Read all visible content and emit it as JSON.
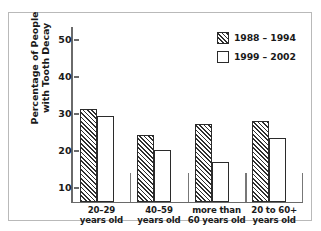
{
  "chart_data": {
    "type": "bar",
    "title": "",
    "xlabel": "",
    "ylabel_lines": [
      "Percentage of People",
      "with Tooth Decay"
    ],
    "categories": [
      [
        "20–29",
        "years old"
      ],
      [
        "40–59",
        "years old"
      ],
      [
        "more than",
        "60 years old"
      ],
      [
        "20 to 60+",
        "years old"
      ]
    ],
    "series": [
      {
        "name": "1988 – 1994",
        "style": "hatched",
        "values": [
          31.3,
          24.3,
          27.2,
          28.2
        ]
      },
      {
        "name": "1999 – 2002",
        "style": "plain",
        "values": [
          29.4,
          20.2,
          17.0,
          23.5
        ]
      }
    ],
    "ylim": [
      0,
      50
    ],
    "yticks": [
      50,
      40,
      30,
      20,
      10
    ],
    "grid": false,
    "legend_position": "top-right"
  },
  "legend": {
    "items": [
      {
        "label": "1988 – 1994",
        "style": "hatched"
      },
      {
        "label": "1999 – 2002",
        "style": "plain"
      }
    ]
  },
  "colors": {
    "ink": "#2b2b2b",
    "axis": "#6a6a6a",
    "border": "#b9b9b9",
    "background": "#ffffff"
  }
}
